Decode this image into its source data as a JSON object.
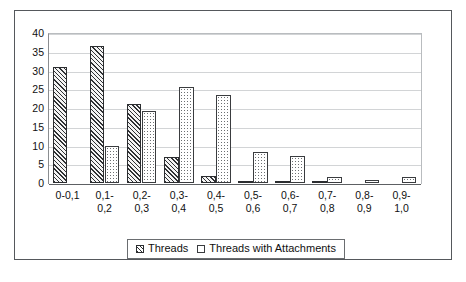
{
  "chart_data": {
    "type": "bar",
    "title": "",
    "subtitle": "",
    "xlabel": "",
    "ylabel": "",
    "ylim": [
      0,
      40
    ],
    "yticks": [
      40,
      35,
      30,
      25,
      20,
      15,
      10,
      5,
      0
    ],
    "grid": true,
    "legend_position": "bottom-center",
    "categories": [
      "0-0,1",
      "0,1-0,2",
      "0,2-0,3",
      "0,3-0,4",
      "0,4-0,5",
      "0,5-0,6",
      "0,6-0,7",
      "0,7-0,8",
      "0,8-0,9",
      "0,9-1,0"
    ],
    "category_lines": [
      [
        "0-0,1"
      ],
      [
        "0,1-",
        "0,2"
      ],
      [
        "0,2-",
        "0,3"
      ],
      [
        "0,3-",
        "0,4"
      ],
      [
        "0,4-",
        "0,5"
      ],
      [
        "0,5-",
        "0,6"
      ],
      [
        "0,6-",
        "0,7"
      ],
      [
        "0,7-",
        "0,8"
      ],
      [
        "0,8-",
        "0,9"
      ],
      [
        "0,9-",
        "1,0"
      ]
    ],
    "series": [
      {
        "name": "Threads",
        "pattern": "diagonal-hatch",
        "values": [
          31,
          36.5,
          21,
          7,
          2,
          0.5,
          0.2,
          0.15,
          0,
          0
        ]
      },
      {
        "name": "Threads with Attachments",
        "pattern": "dotted",
        "values": [
          0,
          10,
          19.3,
          25.5,
          23.5,
          8.2,
          7.2,
          1.6,
          0.7,
          1.5
        ]
      }
    ]
  },
  "legend": {
    "items": [
      {
        "label": "Threads",
        "swatch": "diagonal-hatch-swatch"
      },
      {
        "label": "Threads with Attachments",
        "swatch": "dotted-swatch"
      }
    ]
  },
  "caption": {
    "remnant_text": ""
  },
  "colors": {
    "frame": "#55585c",
    "axis": "#5d6063",
    "gridline": "#d2d4d6",
    "text": "#101010",
    "bar_outline": "#2b2d30"
  }
}
